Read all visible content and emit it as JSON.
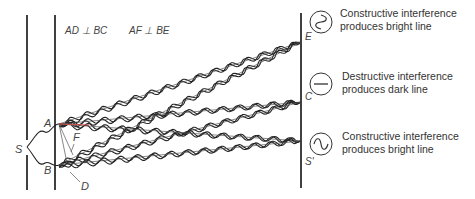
{
  "diagram": {
    "relations": [
      "AD ⊥ BC",
      "AF ⊥ BE"
    ],
    "source_label": "S",
    "slit_labels": [
      "A",
      "B"
    ],
    "construction_labels": [
      "F",
      "D"
    ],
    "screen_points": [
      {
        "label": "E",
        "icon": "constructive-wave-icon",
        "lines": [
          "Constructive interference",
          "produces bright line"
        ]
      },
      {
        "label": "C",
        "icon": "destructive-flat-icon",
        "lines": [
          "Destructive interference",
          "produces dark line"
        ]
      },
      {
        "label": "S'",
        "icon": "constructive-wave-icon",
        "lines": [
          "Constructive interference",
          "produces bright line"
        ]
      }
    ],
    "colors": {
      "ink": "#222222",
      "accent": "#d9534f"
    }
  }
}
